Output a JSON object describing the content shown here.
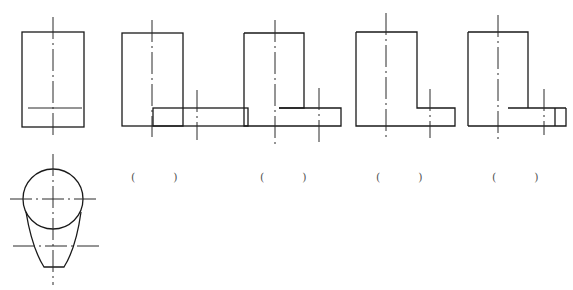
{
  "figure": {
    "given_views": [
      {
        "id": "front-view-given",
        "type": "front-view"
      },
      {
        "id": "top-view-given",
        "type": "top-view"
      }
    ],
    "options": [
      {
        "id": "option-1",
        "label_open": "(",
        "label_close": ")"
      },
      {
        "id": "option-2",
        "label_open": "(",
        "label_close": ")"
      },
      {
        "id": "option-3",
        "label_open": "(",
        "label_close": ")"
      },
      {
        "id": "option-4",
        "label_open": "(",
        "label_close": ")"
      }
    ],
    "colors": {
      "line": "#1a1a1a",
      "background": "#ffffff"
    }
  }
}
